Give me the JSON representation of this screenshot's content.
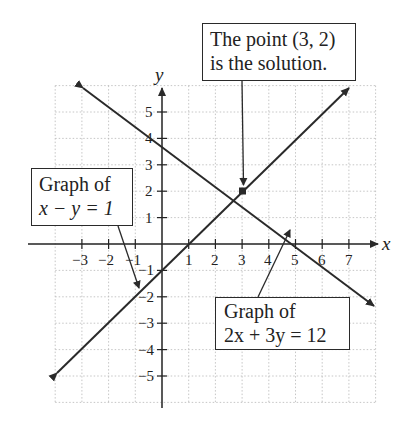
{
  "diagram": {
    "type": "coordinate-plane-system-of-equations",
    "x_axis": {
      "label": "x",
      "tick_labels": [
        "−3",
        "−2",
        "−1",
        "1",
        "2",
        "3",
        "4",
        "5",
        "6",
        "7"
      ],
      "tick_values": [
        -3,
        -2,
        -1,
        1,
        2,
        3,
        4,
        5,
        6,
        7
      ]
    },
    "y_axis": {
      "label": "y",
      "tick_labels": [
        "5",
        "4",
        "3",
        "2",
        "1",
        "−1",
        "−2",
        "−3",
        "−4",
        "−5"
      ],
      "tick_values": [
        5,
        4,
        3,
        2,
        1,
        -1,
        -2,
        -3,
        -4,
        -5
      ]
    },
    "grid": {
      "x_range": [
        -4,
        8
      ],
      "y_range": [
        -6,
        6
      ],
      "style": "dotted"
    },
    "lines": [
      {
        "name": "x-y=1",
        "equation": "x − y = 1",
        "intercepts": {
          "x": 1,
          "y": -1
        }
      },
      {
        "name": "2x+3y=12",
        "equation": "2x + 3y = 12",
        "intercepts": {
          "x": 6,
          "y": 4
        }
      }
    ],
    "solution_point": {
      "x": 3,
      "y": 2
    },
    "callouts": {
      "solution": {
        "line1": "The point (3, 2)",
        "line2": "is the solution."
      },
      "line1": {
        "line1": "Graph of",
        "line2": "x − y = 1"
      },
      "line2": {
        "line1": "Graph of",
        "line2": "2x + 3y = 12"
      }
    }
  }
}
